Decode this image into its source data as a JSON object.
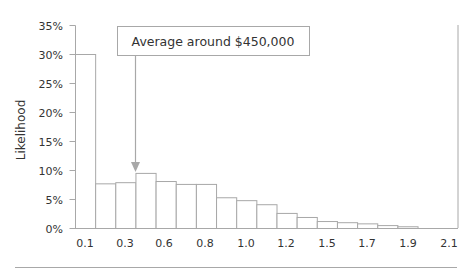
{
  "chart_data": {
    "type": "bar",
    "title": "",
    "xlabel": "",
    "ylabel": "Likelihood",
    "ylim": [
      0,
      35
    ],
    "y_ticks": [
      "0%",
      "5%",
      "10%",
      "15%",
      "20%",
      "25%",
      "30%",
      "35%"
    ],
    "y_tick_values": [
      0,
      5,
      10,
      15,
      20,
      25,
      30,
      35
    ],
    "x_tick_labels": [
      "0.1",
      "0.3",
      "0.6",
      "0.8",
      "1.0",
      "1.2",
      "1.5",
      "1.7",
      "1.9",
      "2.1"
    ],
    "grid": false,
    "legend": null,
    "values": [
      30.0,
      7.7,
      7.9,
      9.5,
      8.1,
      7.6,
      7.6,
      5.3,
      4.8,
      4.1,
      2.6,
      1.9,
      1.2,
      1.0,
      0.8,
      0.5,
      0.3
    ],
    "annotations": [
      {
        "text": "Average around $450,000",
        "points_to_bar_index": 3,
        "style": "boxed label with down arrow"
      }
    ],
    "colors": {
      "bar_fill": "#ffffff",
      "bar_edge": "#a8a8a8",
      "axis": "#a8a8a8",
      "text": "#333333"
    }
  }
}
